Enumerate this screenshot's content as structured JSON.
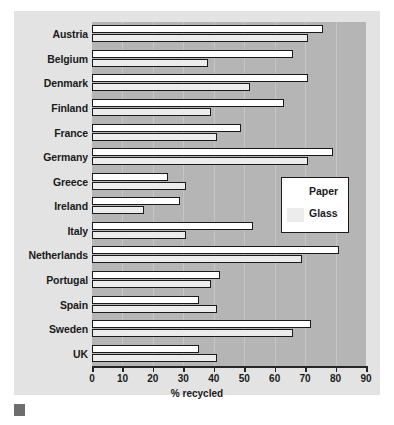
{
  "chart_data": {
    "type": "bar",
    "orientation": "horizontal",
    "title": "",
    "xlabel": "% recycled",
    "ylabel": "",
    "xlim": [
      0,
      90
    ],
    "xticks": [
      0,
      10,
      20,
      30,
      40,
      50,
      60,
      70,
      80,
      90
    ],
    "grid": true,
    "legend_position": "middle-right",
    "categories": [
      "Austria",
      "Belgium",
      "Denmark",
      "Finland",
      "France",
      "Germany",
      "Greece",
      "Ireland",
      "Italy",
      "Netherlands",
      "Portugal",
      "Spain",
      "Sweden",
      "UK"
    ],
    "series": [
      {
        "name": "Paper",
        "color": "#ffffff",
        "values": [
          76,
          66,
          71,
          63,
          49,
          79,
          25,
          29,
          53,
          81,
          42,
          35,
          72,
          35
        ]
      },
      {
        "name": "Glass",
        "color": "#ececec",
        "values": [
          71,
          38,
          52,
          39,
          41,
          71,
          31,
          17,
          31,
          69,
          39,
          41,
          66,
          41
        ]
      }
    ]
  },
  "legend": {
    "items": [
      {
        "label": "Paper",
        "swatch": "paper"
      },
      {
        "label": "Glass",
        "swatch": "glass"
      }
    ]
  },
  "caption": {
    "text": ""
  },
  "colors": {
    "figure_background": "#e3e3e3",
    "plot_background": "#b5b5b5",
    "gridline": "#c6c6c6",
    "bar_outline": "#1b1b1b",
    "axis": "#262626",
    "text": "#1a1a1a"
  }
}
